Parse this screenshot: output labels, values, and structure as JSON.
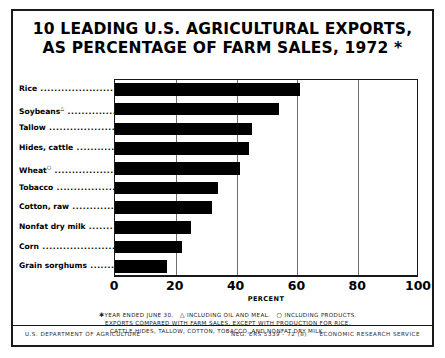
{
  "title": {
    "line1": "10 LEADING U.S. AGRICULTURAL EXPORTS,",
    "line2": "AS PERCENTAGE OF FARM SALES, 1972 *"
  },
  "chart_data": {
    "type": "bar",
    "orientation": "horizontal",
    "title": "10 LEADING U.S. AGRICULTURAL EXPORTS, AS PERCENTAGE OF FARM SALES, 1972 *",
    "xlabel": "PERCENT",
    "ylabel": "",
    "xlim": [
      0,
      100
    ],
    "xticks": [
      0,
      20,
      40,
      60,
      80,
      100
    ],
    "xtick_labels": [
      "0",
      "20",
      "40",
      "60",
      "80",
      "100"
    ],
    "grid": true,
    "grid_axis": "x",
    "legend": false,
    "bar_color": "#000000",
    "categories": [
      "Rice",
      "Soybeans",
      "Tallow",
      "Hides, cattle",
      "Wheat",
      "Tobacco",
      "Cotton, raw",
      "Nonfat dry milk",
      "Corn",
      "Grain sorghums"
    ],
    "category_footnote_marks": [
      "",
      "△",
      "",
      "",
      "○",
      "",
      "",
      "",
      "",
      ""
    ],
    "values": [
      61,
      54,
      45,
      44,
      41,
      34,
      32,
      25,
      22,
      17
    ]
  },
  "footnotes": {
    "line1_mark": "✱",
    "line1": "YEAR ENDED JUNE 30.",
    "line1_mark2": "△",
    "line1b": "INCLUDING OIL AND MEAL.",
    "line1_mark3": "○",
    "line1c": "INCLUDING PRODUCTS.",
    "line2": "EXPORTS COMPARED WITH FARM SALES, EXCEPT WITH PRODUCTION FOR RICE,",
    "line3": "CATTLE HIDES, TALLOW, COTTON, TOBACCO, AND NONFAT DRY MILK."
  },
  "credit": {
    "left": "U.S. DEPARTMENT OF AGRICULTURE",
    "neg": "NEG. ERS 5339 - 72 (8)",
    "right": "ECONOMIC RESEARCH SERVICE"
  }
}
